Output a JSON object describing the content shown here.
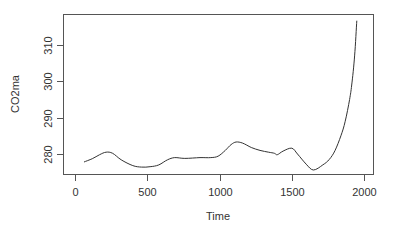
{
  "chart_data": {
    "type": "line",
    "title": "",
    "xlabel": "Time",
    "ylabel": "CO2ma",
    "xlim": [
      0,
      2000
    ],
    "ylim": [
      274.5,
      318.5
    ],
    "x_ticks": [
      0,
      500,
      1000,
      1500,
      2000
    ],
    "y_ticks": [
      280,
      290,
      300,
      310
    ],
    "grid": false,
    "legend": null,
    "series": [
      {
        "name": "CO2ma",
        "color": "#333333",
        "x": [
          62,
          120,
          170,
          215,
          260,
          320,
          400,
          460,
          520,
          580,
          640,
          690,
          760,
          865,
          940,
          990,
          1040,
          1080,
          1115,
          1160,
          1220,
          1280,
          1340,
          1380,
          1400,
          1440,
          1500,
          1540,
          1600,
          1650,
          1715,
          1760,
          1800,
          1840,
          1870,
          1900,
          1915,
          1935,
          1950
        ],
        "y": [
          277.8,
          278.7,
          279.8,
          280.5,
          280.2,
          278.4,
          276.8,
          276.4,
          276.5,
          277.0,
          278.4,
          279.0,
          278.8,
          279.0,
          279.0,
          279.4,
          281.0,
          282.6,
          283.3,
          283.0,
          281.8,
          281.0,
          280.5,
          280.2,
          279.8,
          280.8,
          281.6,
          280.0,
          277.2,
          275.6,
          277.0,
          278.5,
          281.0,
          285.0,
          289.0,
          295.0,
          299.0,
          307.0,
          316.7
        ]
      }
    ]
  }
}
